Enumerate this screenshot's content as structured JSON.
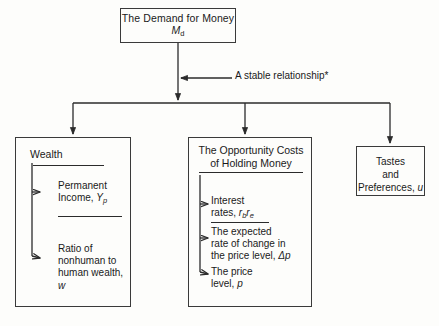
{
  "diagram": {
    "title": "The Demand for Money",
    "root": {
      "line1": "The Demand for Money",
      "line2_symbol": "M",
      "line2_subscript": "d"
    },
    "annotation": "A stable relationship*",
    "branches": [
      {
        "name": "wealth",
        "header": "Wealth",
        "items": [
          {
            "line1": "Permanent",
            "line2": "Income, ",
            "symbol": "Y",
            "subscript": "p"
          },
          {
            "line1": "Ratio of",
            "line2": "nonhuman to",
            "line3": "human wealth, ",
            "symbol": "w",
            "subscript": ""
          }
        ]
      },
      {
        "name": "opportunity-costs",
        "header_line1": "The Opportunity Costs",
        "header_line2": "of Holding Money",
        "items": [
          {
            "line1": "Interest",
            "line2": "rates, ",
            "symbol_b": "r",
            "sub_b": "b",
            "symbol_e": "r",
            "sub_e": "e"
          },
          {
            "line1": "The expected",
            "line2": "rate of change in",
            "line3": "the price level, ",
            "symbol": "Δp"
          },
          {
            "line1": "The price",
            "line2": "level, ",
            "symbol": "p"
          }
        ]
      },
      {
        "name": "tastes-and-preferences",
        "line1": "Tastes",
        "line2": "and",
        "line3": "Preferences, ",
        "symbol": "u"
      }
    ],
    "colors": {
      "stroke": "#3a3a3a",
      "rule": "#2b2b2b",
      "text": "#1a1a1a",
      "background": "#fdfdfb"
    }
  }
}
